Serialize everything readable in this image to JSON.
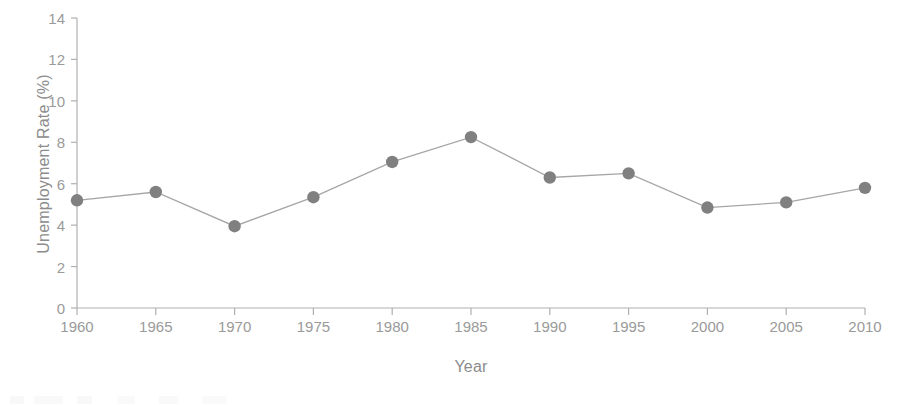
{
  "chart_data": {
    "type": "line",
    "title": "",
    "xlabel": "Year",
    "ylabel": "Unemployment Rate (%)",
    "x": [
      1960,
      1965,
      1970,
      1975,
      1980,
      1985,
      1990,
      1995,
      2000,
      2005,
      2010
    ],
    "values": [
      5.2,
      5.6,
      3.95,
      5.35,
      7.05,
      8.25,
      6.3,
      6.5,
      4.85,
      5.1,
      5.8
    ],
    "xlim": [
      1960,
      2010
    ],
    "ylim": [
      0,
      14
    ],
    "xticks": [
      "1960",
      "1965",
      "1970",
      "1975",
      "1980",
      "1985",
      "1990",
      "1995",
      "2000",
      "2005",
      "2010"
    ],
    "yticks": [
      "0",
      "2",
      "4",
      "6",
      "8",
      "10",
      "12",
      "14"
    ],
    "grid": false,
    "legend": "none",
    "series_color": "#808080",
    "line_color": "#a0a0a0",
    "axis_color": "#b0b0b0",
    "text_color": "#8c8c8c"
  }
}
